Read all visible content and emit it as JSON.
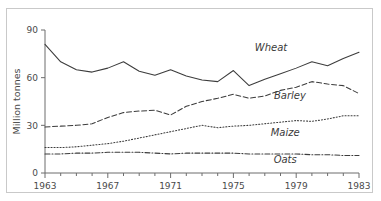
{
  "figure": {
    "partial_header_text": "",
    "frame_color": "#c9c9c9"
  },
  "chart_data": {
    "type": "line",
    "title": "",
    "subtitle": "",
    "xlabel": "",
    "ylabel": "Million tonnes",
    "xlim": [
      1963,
      1983
    ],
    "ylim": [
      0,
      90
    ],
    "yticks": [
      0,
      30,
      60,
      90
    ],
    "ytick_labels": [
      "0",
      "30",
      "60",
      "90"
    ],
    "xticks": [
      1963,
      1967,
      1971,
      1975,
      1979,
      1983
    ],
    "xtick_labels": [
      "1963",
      "1967",
      "1971",
      "1975",
      "1979",
      "1983"
    ],
    "minor_xtick_interval": 1,
    "grid": false,
    "legend": "inline-series-labels",
    "x": [
      1963,
      1964,
      1965,
      1966,
      1967,
      1968,
      1969,
      1970,
      1971,
      1972,
      1973,
      1974,
      1975,
      1976,
      1977,
      1978,
      1979,
      1980,
      1981,
      1982,
      1983
    ],
    "series": [
      {
        "name": "Wheat",
        "style": "solid",
        "label_x": 1977.4,
        "label_y": 76.5,
        "values": [
          81,
          70,
          65,
          63.5,
          66,
          70,
          64,
          61.5,
          65,
          61,
          58.5,
          57.5,
          64.5,
          55,
          59,
          62.5,
          66,
          70,
          67.5,
          72,
          76
        ]
      },
      {
        "name": "Barley",
        "style": "dashed",
        "label_x": 1978.6,
        "label_y": 46.5,
        "values": [
          29,
          29.5,
          30,
          31,
          35,
          38,
          39,
          39.5,
          36.5,
          42,
          45,
          47,
          49.5,
          47,
          48.5,
          52,
          54,
          57.5,
          56,
          55,
          50
        ]
      },
      {
        "name": "Maize",
        "style": "dotted",
        "label_x": 1978.3,
        "label_y": 23.5,
        "values": [
          16,
          16,
          16.5,
          17.5,
          18.5,
          20,
          22,
          24,
          26,
          28,
          30,
          28.5,
          29.5,
          30,
          31,
          32,
          33,
          32.5,
          34,
          36,
          36
        ]
      },
      {
        "name": "Oats",
        "style": "dashdot",
        "label_x": 1978.3,
        "label_y": 6.5,
        "values": [
          12,
          12,
          12.5,
          12.5,
          13,
          13,
          13,
          12.5,
          12,
          12.5,
          12.5,
          12.5,
          12.5,
          12,
          12,
          12,
          12,
          11.5,
          11.5,
          11,
          11
        ]
      }
    ]
  }
}
